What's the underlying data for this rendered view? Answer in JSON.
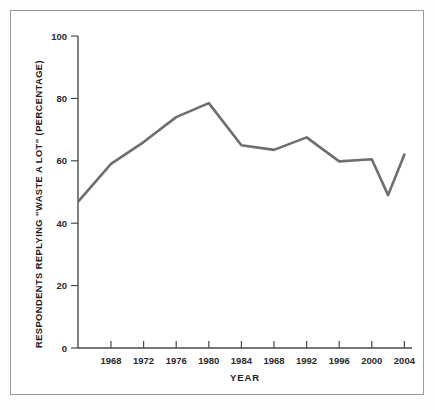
{
  "chart_data": {
    "type": "line",
    "title": "",
    "xlabel": "YEAR",
    "ylabel": "RESPONDENTS REPLYING \"WASTE A LOT\" (PERCENTAGE)",
    "xlim": [
      1964,
      2005
    ],
    "ylim": [
      0,
      100
    ],
    "grid": false,
    "legend": null,
    "line_color": "#6e6e6e",
    "x_tick_labels": [
      "1968",
      "1972",
      "1976",
      "1980",
      "1984",
      "1968",
      "1992",
      "1996",
      "2000",
      "2004"
    ],
    "x_tick_values": [
      1968,
      1972,
      1976,
      1980,
      1984,
      1988,
      1992,
      1996,
      2000,
      2004
    ],
    "y_tick_labels": [
      "0",
      "20",
      "40",
      "60",
      "80",
      "100"
    ],
    "y_tick_values": [
      0,
      20,
      40,
      60,
      80,
      100
    ],
    "x": [
      1964,
      1968,
      1972,
      1976,
      1980,
      1984,
      1988,
      1992,
      1996,
      2000,
      2002,
      2004
    ],
    "values": [
      47,
      59,
      66,
      74,
      78.5,
      65,
      63.5,
      67.5,
      59.8,
      60.5,
      49,
      62
    ],
    "series": [
      {
        "name": "Respondents replying \"waste a lot\"",
        "values": [
          47,
          59,
          66,
          74,
          78.5,
          65,
          63.5,
          67.5,
          59.8,
          60.5,
          49,
          62
        ]
      }
    ]
  }
}
